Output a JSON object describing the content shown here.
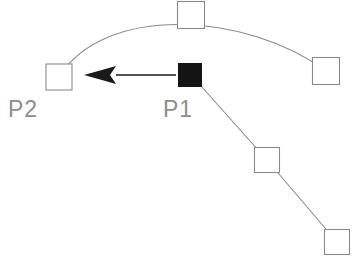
{
  "canvas": {
    "width": 353,
    "height": 262,
    "background": "#ffffff"
  },
  "style": {
    "geometry_stroke": "#8a8a8a",
    "handle_stroke": "#8a8a8a",
    "handle_fill": "#ffffff",
    "selected_fill": "#141414",
    "arrow_color": "#1a1a1a",
    "label_color": "#8d8d8d"
  },
  "labels": {
    "p1": "P1",
    "p2": "P2"
  },
  "label_positions": {
    "p1": {
      "x": 163,
      "y": 117
    },
    "p2": {
      "x": 8,
      "y": 117
    }
  },
  "handles": [
    {
      "name": "control-point-p2",
      "x": 59,
      "y": 77,
      "size": 26,
      "state": "unselected"
    },
    {
      "name": "control-point-curve-top",
      "x": 191,
      "y": 15,
      "size": 27,
      "state": "unselected"
    },
    {
      "name": "control-point-curve-right",
      "x": 326,
      "y": 71,
      "size": 27,
      "state": "unselected"
    },
    {
      "name": "control-point-p1",
      "x": 190,
      "y": 75,
      "size": 23,
      "state": "selected"
    },
    {
      "name": "control-point-line-mid",
      "x": 267,
      "y": 160,
      "size": 25,
      "state": "unselected"
    },
    {
      "name": "control-point-line-end",
      "x": 337,
      "y": 242,
      "size": 25,
      "state": "unselected"
    }
  ],
  "curve": {
    "name": "arc-path",
    "start": {
      "x": 59,
      "y": 77
    },
    "control1": {
      "x": 104,
      "y": 4
    },
    "control2": {
      "x": 246,
      "y": 12
    },
    "end": {
      "x": 326,
      "y": 71
    },
    "passes_through": {
      "x": 191,
      "y": 15
    }
  },
  "polyline": {
    "name": "descending-line",
    "points": [
      {
        "x": 201,
        "y": 86
      },
      {
        "x": 267,
        "y": 160
      },
      {
        "x": 337,
        "y": 242
      }
    ]
  },
  "arrow": {
    "name": "move-vector-arrow",
    "tail": {
      "x": 176,
      "y": 75
    },
    "tip": {
      "x": 84,
      "y": 75
    },
    "head_base_x": 116,
    "head_half_height": 9,
    "shaft_width": 1.4,
    "direction": "left"
  }
}
